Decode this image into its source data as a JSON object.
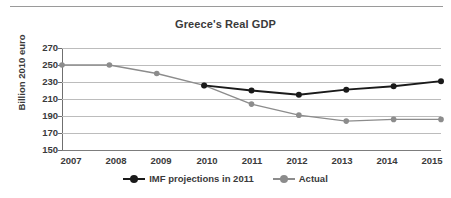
{
  "chart_data": {
    "type": "line",
    "title": "Greece's Real GDP",
    "xlabel": "",
    "ylabel": "Billion 2010 euro",
    "categories": [
      "2007",
      "2008",
      "2009",
      "2010",
      "2011",
      "2012",
      "2013",
      "2014",
      "2015"
    ],
    "series": [
      {
        "name": "IMF projections in 2011",
        "color": "#1a1a1a",
        "x": [
          "2010",
          "2011",
          "2012",
          "2013",
          "2014",
          "2015"
        ],
        "values": [
          226,
          220,
          215,
          221,
          225,
          231
        ]
      },
      {
        "name": "Actual",
        "color": "#8c8c8c",
        "x": [
          "2007",
          "2008",
          "2009",
          "2010",
          "2011",
          "2012",
          "2013",
          "2014",
          "2015"
        ],
        "values": [
          250,
          250,
          240,
          226,
          204,
          191,
          184,
          186,
          186
        ]
      }
    ],
    "ylim": [
      150,
      270
    ],
    "yticks": [
      150,
      170,
      190,
      210,
      230,
      250,
      270
    ],
    "grid": true,
    "legend_position": "bottom"
  },
  "legend": {
    "entries": [
      {
        "label": "IMF projections in 2011"
      },
      {
        "label": "Actual"
      }
    ]
  },
  "colors": {
    "projection": "#1a1a1a",
    "actual": "#8c8c8c",
    "grid": "#bcbcbc",
    "axis": "#6f6f6f",
    "text": "#3a3a3a"
  }
}
